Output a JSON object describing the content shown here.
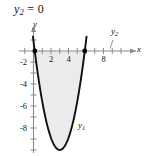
{
  "figure": {
    "equation_label": {
      "lhs_base": "y",
      "lhs_sub": "2",
      "operator": "=",
      "rhs": "0"
    },
    "axis_names": {
      "x": "x",
      "y": "y"
    },
    "curve_labels": {
      "parabola_base": "y",
      "parabola_sub": "1",
      "line_base": "y",
      "line_sub": "2"
    },
    "colors": {
      "curve": "#111111",
      "axis": "#8a8a8a",
      "shade": "#ebebeb",
      "text": "#111111",
      "point": "#000000"
    }
  },
  "chart_data": {
    "type": "line",
    "title": "y2 = 0",
    "xlabel": "x",
    "ylabel": "y",
    "xlim": [
      -1.2,
      9.6
    ],
    "ylim": [
      -9.8,
      1.2
    ],
    "grid": false,
    "legend_position": "inline-annotation",
    "x_ticks": [
      -1,
      0,
      1,
      2,
      3,
      4,
      5,
      6,
      7,
      8,
      9
    ],
    "x_tick_labels": [
      {
        "value": 2,
        "label": "2"
      },
      {
        "value": 4,
        "label": "4"
      },
      {
        "value": 8,
        "label": "8"
      }
    ],
    "y_ticks": [
      -2,
      -4,
      -6,
      -8
    ],
    "y_tick_labels": [
      {
        "value": -2,
        "label": "-2"
      },
      {
        "value": -4,
        "label": "-4"
      },
      {
        "value": -6,
        "label": "-6"
      },
      {
        "value": -8,
        "label": "-8"
      }
    ],
    "series": [
      {
        "name": "y1",
        "type": "parabola",
        "expression_vertex": {
          "h": 3.0,
          "k": -9.0,
          "a": 1.1
        },
        "roots": [
          0.15,
          5.85
        ],
        "x": [
          0.15,
          0.5,
          1.0,
          1.5,
          2.0,
          2.5,
          3.0,
          3.5,
          4.0,
          4.5,
          5.0,
          5.5,
          5.85
        ],
        "values": [
          0.0,
          -2.2,
          -4.6,
          -6.5,
          -7.9,
          -8.7,
          -9.0,
          -8.7,
          -7.9,
          -6.5,
          -4.6,
          -2.2,
          0.0
        ]
      },
      {
        "name": "y2",
        "type": "horizontal-line",
        "values": [
          0,
          0
        ]
      }
    ],
    "shaded_region": {
      "between": [
        "y1",
        "y2"
      ],
      "x_from": 0.15,
      "x_to": 5.85,
      "fill": "#ebebeb"
    },
    "intersection_points": [
      {
        "x": 0.15,
        "y": 0
      },
      {
        "x": 5.85,
        "y": 0
      }
    ]
  }
}
